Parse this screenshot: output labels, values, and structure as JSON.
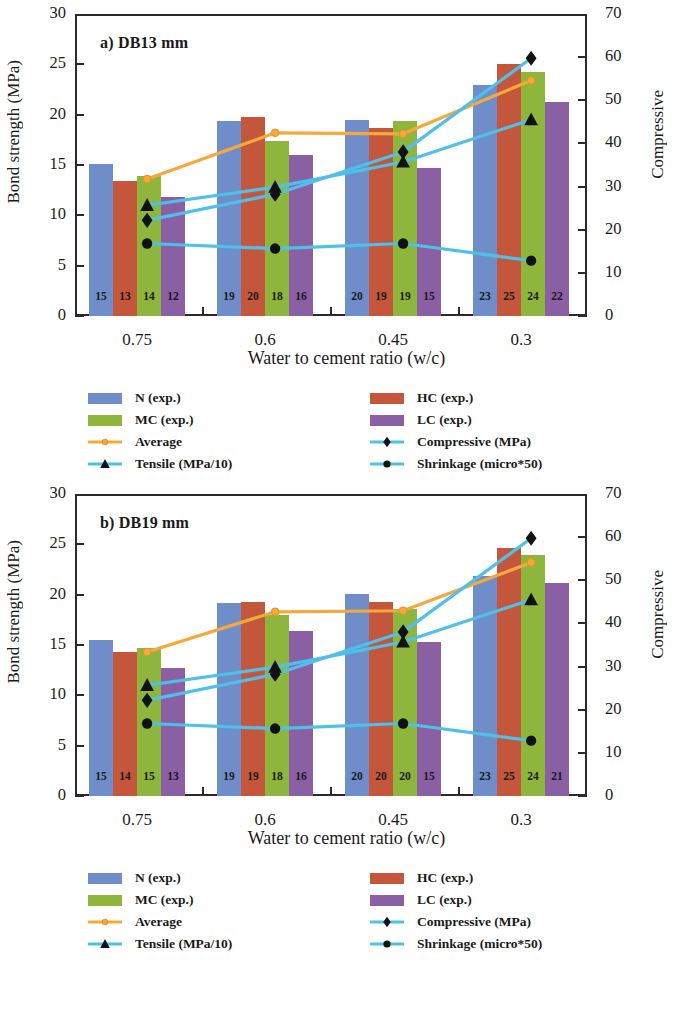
{
  "figure": {
    "xlabel": "Water to cement ratio (w/c)",
    "ylabel_left": "Bond strength (MPa)",
    "ylabel_right": "Compressive",
    "y_left_ticks": [
      "30",
      "25",
      "20",
      "15",
      "10",
      "5",
      "0"
    ],
    "y_right_ticks": [
      "70",
      "60",
      "50",
      "40",
      "30",
      "20",
      "10",
      "0"
    ],
    "x_ticks": [
      "0.75",
      "0.6",
      "0.45",
      "0.3"
    ]
  },
  "legend": {
    "items": [
      {
        "label": "N (exp.)",
        "kind": "swatch",
        "color": "#6f8ec9",
        "icon": "blue-swatch"
      },
      {
        "label": "HC (exp.)",
        "kind": "swatch",
        "color": "#c4563c",
        "icon": "red-swatch"
      },
      {
        "label": "MC (exp.)",
        "kind": "swatch",
        "color": "#8fb63c",
        "icon": "green-swatch"
      },
      {
        "label": "LC (exp.)",
        "kind": "swatch",
        "color": "#8a5fa3",
        "icon": "purple-swatch"
      },
      {
        "label": "Average",
        "kind": "line-marker",
        "color": "#f5a93c",
        "marker": "circle",
        "icon": "average-line-marker"
      },
      {
        "label": "Compressive (MPa)",
        "kind": "line-marker",
        "color": "#4ec0ea",
        "marker": "diamond",
        "icon": "compressive-line-marker"
      },
      {
        "label": "Tensile (MPa/10)",
        "kind": "line-marker",
        "color": "#4ec0ea",
        "marker": "triangle",
        "icon": "tensile-line-marker"
      },
      {
        "label": "Shrinkage (micro*50)",
        "kind": "line-marker",
        "color": "#4ec0ea",
        "marker": "dot",
        "icon": "shrinkage-line-marker"
      }
    ]
  },
  "chart_data": [
    {
      "type": "bar",
      "title": "a) DB13 mm",
      "categories": [
        "0.75",
        "0.6",
        "0.45",
        "0.3"
      ],
      "xlabel": "Water to cement ratio (w/c)",
      "ylabel": "Bond strength (MPa)",
      "ylabel_secondary": "Compressive",
      "ylim": [
        0,
        30
      ],
      "ylim_secondary": [
        0,
        70
      ],
      "grid": false,
      "legend_position": "below",
      "series": [
        {
          "name": "N (exp.)",
          "type": "bar",
          "color": "#6f8ec9",
          "values": [
            15.1,
            19.4,
            19.5,
            22.9
          ],
          "labels": [
            "15",
            "19",
            "20",
            "23"
          ]
        },
        {
          "name": "HC (exp.)",
          "type": "bar",
          "color": "#c4563c",
          "values": [
            13.4,
            19.8,
            18.7,
            25.0
          ],
          "labels": [
            "13",
            "20",
            "19",
            "25"
          ]
        },
        {
          "name": "MC (exp.)",
          "type": "bar",
          "color": "#8fb63c",
          "values": [
            13.9,
            17.4,
            19.4,
            24.2
          ],
          "labels": [
            "14",
            "18",
            "19",
            "24"
          ]
        },
        {
          "name": "LC (exp.)",
          "type": "bar",
          "color": "#8a5fa3",
          "values": [
            11.8,
            16.0,
            14.7,
            21.3
          ],
          "labels": [
            "12",
            "16",
            "15",
            "22"
          ]
        },
        {
          "name": "Average",
          "type": "line",
          "color": "#f5a93c",
          "marker": "circle",
          "values": [
            13.6,
            18.2,
            18.1,
            23.4
          ]
        },
        {
          "name": "Compressive (MPa)",
          "type": "line",
          "color": "#4ec0ea",
          "marker": "diamond",
          "values": [
            9.5,
            12.1,
            16.3,
            25.6
          ]
        },
        {
          "name": "Tensile (MPa/10)",
          "type": "line",
          "color": "#4ec0ea",
          "marker": "triangle",
          "values": [
            11.0,
            12.8,
            15.3,
            19.5
          ]
        },
        {
          "name": "Shrinkage (micro*50)",
          "type": "line",
          "color": "#4ec0ea",
          "marker": "dot",
          "values": [
            7.2,
            6.7,
            7.2,
            5.5
          ]
        }
      ]
    },
    {
      "type": "bar",
      "title": "b) DB19 mm",
      "categories": [
        "0.75",
        "0.6",
        "0.45",
        "0.3"
      ],
      "xlabel": "Water to cement ratio (w/c)",
      "ylabel": "Bond strength (MPa)",
      "ylabel_secondary": "Compressive",
      "ylim": [
        0,
        30
      ],
      "ylim_secondary": [
        0,
        70
      ],
      "grid": false,
      "legend_position": "below",
      "series": [
        {
          "name": "N (exp.)",
          "type": "bar",
          "color": "#6f8ec9",
          "values": [
            15.5,
            19.2,
            20.1,
            21.9
          ],
          "labels": [
            "15",
            "19",
            "20",
            "23"
          ]
        },
        {
          "name": "HC (exp.)",
          "type": "bar",
          "color": "#c4563c",
          "values": [
            14.3,
            19.3,
            19.3,
            24.6
          ],
          "labels": [
            "14",
            "19",
            "20",
            "25"
          ]
        },
        {
          "name": "MC (exp.)",
          "type": "bar",
          "color": "#8fb63c",
          "values": [
            14.7,
            18.0,
            18.6,
            23.9
          ],
          "labels": [
            "15",
            "18",
            "20",
            "24"
          ]
        },
        {
          "name": "LC (exp.)",
          "type": "bar",
          "color": "#8a5fa3",
          "values": [
            12.7,
            16.4,
            15.3,
            21.2
          ],
          "labels": [
            "13",
            "16",
            "15",
            "21"
          ]
        },
        {
          "name": "Average",
          "type": "line",
          "color": "#f5a93c",
          "marker": "circle",
          "values": [
            14.3,
            18.3,
            18.4,
            23.2
          ]
        },
        {
          "name": "Compressive (MPa)",
          "type": "line",
          "color": "#4ec0ea",
          "marker": "diamond",
          "values": [
            9.5,
            12.1,
            16.3,
            25.6
          ]
        },
        {
          "name": "Tensile (MPa/10)",
          "type": "line",
          "color": "#4ec0ea",
          "marker": "triangle",
          "values": [
            11.0,
            12.8,
            15.3,
            19.5
          ]
        },
        {
          "name": "Shrinkage (micro*50)",
          "type": "line",
          "color": "#4ec0ea",
          "marker": "dot",
          "values": [
            7.2,
            6.7,
            7.2,
            5.5
          ]
        }
      ]
    }
  ]
}
